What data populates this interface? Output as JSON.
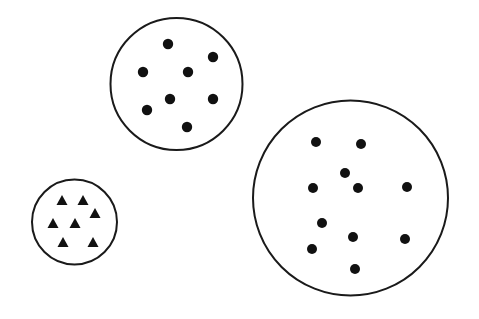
{
  "figure": {
    "title": "",
    "canvas": {
      "width": 479,
      "height": 319,
      "background": "#ffffff"
    }
  },
  "chart_data": {
    "type": "scatter",
    "title": "",
    "subtitle": "",
    "xlabel": "",
    "ylabel": "",
    "xlim": [
      0,
      479
    ],
    "ylim": [
      0,
      319
    ],
    "grid": false,
    "legend": "none",
    "annotations": [],
    "tick_labels": {
      "x": [],
      "y": []
    },
    "groups": [
      {
        "name": "top-circle-dots",
        "label": "",
        "mark": "dot",
        "mark_shape": "circle",
        "mark_color": "#111111",
        "mark_radius": 5.2,
        "count": 8,
        "outline": {
          "shape": "circle",
          "cx": 176.5,
          "cy": 84,
          "r": 66,
          "stroke": "#1a1a1a",
          "stroke_width": 2,
          "fill": "#ffffff"
        },
        "points": [
          {
            "x": 168,
            "y": 44
          },
          {
            "x": 213,
            "y": 57
          },
          {
            "x": 143,
            "y": 72
          },
          {
            "x": 188,
            "y": 72
          },
          {
            "x": 170,
            "y": 99
          },
          {
            "x": 213,
            "y": 99
          },
          {
            "x": 147,
            "y": 110
          },
          {
            "x": 187,
            "y": 127
          }
        ]
      },
      {
        "name": "small-circle-triangles",
        "label": "",
        "mark": "triangle",
        "mark_shape": "triangle-up",
        "mark_color": "#111111",
        "mark_size": 11,
        "count": 7,
        "outline": {
          "shape": "circle",
          "cx": 74.5,
          "cy": 222,
          "r": 42.5,
          "stroke": "#1a1a1a",
          "stroke_width": 2,
          "fill": "#ffffff"
        },
        "points": [
          {
            "x": 62,
            "y": 200
          },
          {
            "x": 83,
            "y": 200
          },
          {
            "x": 95,
            "y": 213
          },
          {
            "x": 53,
            "y": 223
          },
          {
            "x": 75,
            "y": 223
          },
          {
            "x": 63,
            "y": 242
          },
          {
            "x": 93,
            "y": 242
          }
        ]
      },
      {
        "name": "large-circle-dots",
        "label": "",
        "mark": "dot",
        "mark_shape": "circle",
        "mark_color": "#111111",
        "mark_radius": 5.0,
        "count": 11,
        "outline": {
          "shape": "circle",
          "cx": 350.5,
          "cy": 198,
          "r": 97.5,
          "stroke": "#1a1a1a",
          "stroke_width": 2,
          "fill": "#ffffff"
        },
        "points": [
          {
            "x": 316,
            "y": 142
          },
          {
            "x": 361,
            "y": 144
          },
          {
            "x": 345,
            "y": 173
          },
          {
            "x": 313,
            "y": 188
          },
          {
            "x": 358,
            "y": 188
          },
          {
            "x": 407,
            "y": 187
          },
          {
            "x": 322,
            "y": 223
          },
          {
            "x": 353,
            "y": 237
          },
          {
            "x": 405,
            "y": 239
          },
          {
            "x": 312,
            "y": 249
          },
          {
            "x": 355,
            "y": 269
          }
        ]
      }
    ]
  }
}
